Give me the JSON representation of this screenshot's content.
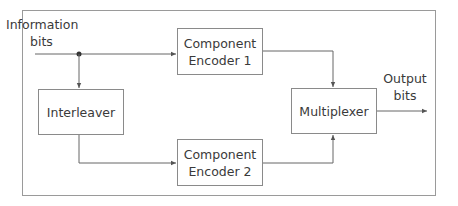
{
  "diagram": {
    "title": "",
    "input_label": {
      "line1": "Information",
      "line2": "bits"
    },
    "output_label": {
      "line1": "Output",
      "line2": "bits"
    },
    "blocks": {
      "encoder1": {
        "line1": "Component",
        "line2": "Encoder 1"
      },
      "encoder2": {
        "line1": "Component",
        "line2": "Encoder 2"
      },
      "interleaver": {
        "label": "Interleaver"
      },
      "multiplexer": {
        "label": "Multiplexer"
      }
    },
    "edges": [
      {
        "from": "Information bits",
        "to": "Component Encoder 1"
      },
      {
        "from": "Information bits",
        "to": "Interleaver"
      },
      {
        "from": "Interleaver",
        "to": "Component Encoder 2"
      },
      {
        "from": "Component Encoder 1",
        "to": "Multiplexer"
      },
      {
        "from": "Component Encoder 2",
        "to": "Multiplexer"
      },
      {
        "from": "Multiplexer",
        "to": "Output bits"
      }
    ],
    "colors": {
      "line": "#555555",
      "border": "#8a8a8a",
      "text": "#3a3a3a"
    }
  }
}
